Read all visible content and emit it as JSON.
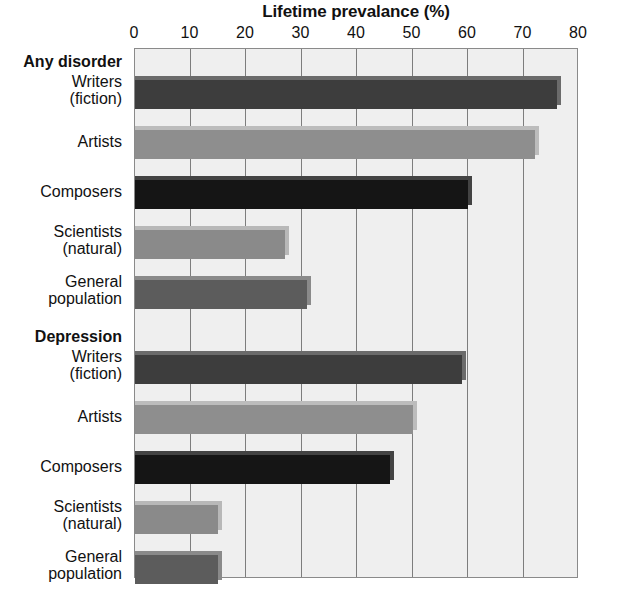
{
  "chart_data": {
    "type": "bar",
    "orientation": "horizontal",
    "title": "Lifetime prevalance (%)",
    "xlabel": "Lifetime prevalance (%)",
    "ylabel": "",
    "xlim": [
      0,
      80
    ],
    "xticks": [
      0,
      10,
      20,
      30,
      40,
      50,
      60,
      70,
      80
    ],
    "xtick_labels": [
      "0",
      "10",
      "20",
      "30",
      "40",
      "50",
      "60",
      "70",
      "80"
    ],
    "grid": true,
    "legend": "none",
    "groups": [
      {
        "name": "Any disorder",
        "categories": [
          "Writers (fiction)",
          "Artists",
          "Composers",
          "Scientists (natural)",
          "General population"
        ],
        "values": [
          76,
          72,
          60,
          27,
          31
        ]
      },
      {
        "name": "Depression",
        "categories": [
          "Writers (fiction)",
          "Artists",
          "Composers",
          "Scientists (natural)",
          "General population"
        ],
        "values": [
          59,
          50,
          46,
          15,
          15
        ]
      }
    ],
    "bars": [
      {
        "group": "Any disorder",
        "label_line1": "Writers",
        "label_line2": "(fiction)",
        "value": 76,
        "color": "#3d3d3d"
      },
      {
        "group": "Any disorder",
        "label_line1": "Artists",
        "label_line2": "",
        "value": 72,
        "color": "#8e8e8e"
      },
      {
        "group": "Any disorder",
        "label_line1": "Composers",
        "label_line2": "",
        "value": 60,
        "color": "#151515"
      },
      {
        "group": "Any disorder",
        "label_line1": "Scientists",
        "label_line2": "(natural)",
        "value": 27,
        "color": "#8a8a8a"
      },
      {
        "group": "Any disorder",
        "label_line1": "General",
        "label_line2": "population",
        "value": 31,
        "color": "#5c5c5c"
      },
      {
        "group": "Depression",
        "label_line1": "Writers",
        "label_line2": "(fiction)",
        "value": 59,
        "color": "#3d3d3d"
      },
      {
        "group": "Depression",
        "label_line1": "Artists",
        "label_line2": "",
        "value": 50,
        "color": "#8e8e8e"
      },
      {
        "group": "Depression",
        "label_line1": "Composers",
        "label_line2": "",
        "value": 46,
        "color": "#151515"
      },
      {
        "group": "Depression",
        "label_line1": "Scientists",
        "label_line2": "(natural)",
        "value": 15,
        "color": "#8a8a8a"
      },
      {
        "group": "Depression",
        "label_line1": "General",
        "label_line2": "population",
        "value": 15,
        "color": "#5c5c5c"
      }
    ],
    "group_headers": [
      {
        "text": "Any disorder"
      },
      {
        "text": "Depression"
      }
    ],
    "colors": {
      "plot_background": "#efefef",
      "plot_border": "#8a8a8a",
      "gridline": "#7d7d7d",
      "page_background": "#ffffff",
      "text": "#111111"
    }
  }
}
